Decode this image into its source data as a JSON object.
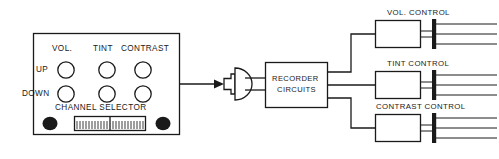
{
  "diagram": {
    "colors": {
      "line": "#1a1a1a",
      "background": "#ffffff",
      "fill": "#ffffff"
    },
    "remote_panel": {
      "name": "remote control panel",
      "column_labels": [
        "VOL.",
        "TINT",
        "CONTRAST"
      ],
      "row_labels": [
        "UP",
        "DOWN"
      ],
      "selector_label": "CHANNEL SELECTOR",
      "button_count": 6,
      "indicator_dots": 2
    },
    "transducer": {
      "name": "ultrasonic transducer",
      "type": "speaker-symbol"
    },
    "recorder": {
      "line1": "RECORDER",
      "line2": "CIRCUITS"
    },
    "controls": [
      {
        "label": "VOL. CONTROL",
        "output_lines": 3
      },
      {
        "label": "TINT CONTROL",
        "output_lines": 3
      },
      {
        "label": "CONTRAST CONTROL",
        "output_lines": 3
      }
    ]
  }
}
